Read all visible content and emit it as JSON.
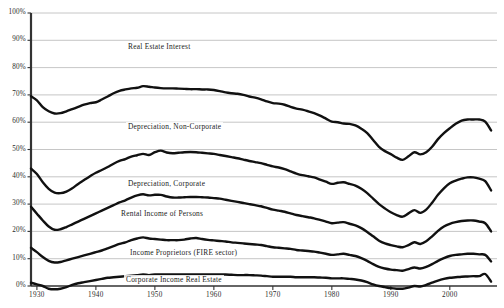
{
  "chart_data": {
    "type": "line",
    "title": "",
    "subtitle": "",
    "xlabel": "",
    "ylabel": "",
    "xlim": [
      1929,
      2008
    ],
    "ylim": [
      0,
      100
    ],
    "grid": true,
    "grid_orientation": "horizontal",
    "legend_position": "inline-band-labels",
    "y_tick_labels": [
      "0%",
      "10%",
      "20%",
      "30%",
      "40%",
      "50%",
      "60%",
      "70%",
      "80%",
      "90%",
      "100%"
    ],
    "y_tick_values": [
      0,
      10,
      20,
      30,
      40,
      50,
      60,
      70,
      80,
      90,
      100
    ],
    "x_tick_labels": [
      "1930",
      "1940",
      "1950",
      "1960",
      "1970",
      "1980",
      "1990",
      "2000"
    ],
    "x_tick_values": [
      1930,
      1940,
      1950,
      1960,
      1970,
      1980,
      1990,
      2000
    ],
    "line_color": "#111111",
    "grid_color": "#b8b8b8",
    "axis_color": "#333333",
    "band_labels": [
      "Real Estate Interest",
      "Depreciation, Non-Corporate",
      "Depreciation, Corporate",
      "Rental Income of Persons",
      "Income Proprietors (FIRE sector)",
      "Corporate Income Real Estate"
    ],
    "x": [
      1929,
      1930,
      1931,
      1932,
      1933,
      1934,
      1935,
      1936,
      1937,
      1938,
      1939,
      1940,
      1941,
      1942,
      1943,
      1944,
      1945,
      1946,
      1947,
      1948,
      1949,
      1950,
      1951,
      1952,
      1953,
      1954,
      1955,
      1956,
      1957,
      1958,
      1959,
      1960,
      1961,
      1962,
      1963,
      1964,
      1965,
      1966,
      1967,
      1968,
      1969,
      1970,
      1971,
      1972,
      1973,
      1974,
      1975,
      1976,
      1977,
      1978,
      1979,
      1980,
      1981,
      1982,
      1983,
      1984,
      1985,
      1986,
      1987,
      1988,
      1989,
      1990,
      1991,
      1992,
      1993,
      1994,
      1995,
      1996,
      1997,
      1998,
      1999,
      2000,
      2001,
      2002,
      2003,
      2004,
      2005,
      2006,
      2007
    ],
    "series": [
      {
        "name": "Real Estate Interest",
        "description": "Cumulative top boundary (total, 100% minus residual)",
        "values": [
          69.5,
          68.0,
          65.5,
          64.0,
          63.2,
          63.3,
          64.0,
          64.8,
          65.6,
          66.4,
          67.0,
          67.3,
          68.3,
          69.4,
          70.6,
          71.5,
          72.0,
          72.4,
          72.6,
          73.2,
          73.0,
          72.7,
          72.5,
          72.4,
          72.4,
          72.3,
          72.2,
          72.1,
          72.1,
          72.0,
          72.0,
          71.8,
          71.4,
          70.9,
          70.6,
          70.4,
          70.0,
          69.4,
          69.0,
          68.4,
          67.6,
          67.0,
          66.8,
          66.4,
          65.6,
          65.0,
          64.6,
          64.0,
          63.3,
          62.4,
          61.3,
          60.2,
          60.0,
          59.5,
          59.4,
          58.8,
          57.6,
          56.0,
          53.5,
          51.0,
          49.4,
          48.3,
          47.0,
          46.2,
          47.5,
          49.0,
          48.2,
          49.0,
          51.0,
          53.8,
          56.0,
          57.8,
          59.4,
          60.6,
          61.0,
          61.0,
          61.0,
          60.2,
          57.0
        ]
      },
      {
        "name": "Depreciation, Non-Corporate",
        "description": "Cumulative boundary below Real Estate Interest",
        "values": [
          43.0,
          41.0,
          38.0,
          35.6,
          34.2,
          34.0,
          34.6,
          35.8,
          37.4,
          38.8,
          40.2,
          41.5,
          42.5,
          43.6,
          44.8,
          45.8,
          46.5,
          47.4,
          47.9,
          48.4,
          48.0,
          49.0,
          49.6,
          48.9,
          48.6,
          48.8,
          49.0,
          49.1,
          49.0,
          48.8,
          48.6,
          48.4,
          48.0,
          47.6,
          47.2,
          46.8,
          46.3,
          45.8,
          45.4,
          45.0,
          44.4,
          43.8,
          43.4,
          42.8,
          42.0,
          41.2,
          40.6,
          40.2,
          39.8,
          39.0,
          38.2,
          37.4,
          37.8,
          38.0,
          37.4,
          36.8,
          35.6,
          34.0,
          32.0,
          30.0,
          28.4,
          27.0,
          26.0,
          25.4,
          26.6,
          27.8,
          26.8,
          28.0,
          30.5,
          33.4,
          35.8,
          37.6,
          38.6,
          39.3,
          39.8,
          39.8,
          39.3,
          38.4,
          35.0
        ]
      },
      {
        "name": "Depreciation, Corporate",
        "description": "Cumulative boundary below Depreciation, Non-Corporate",
        "values": [
          29.0,
          26.5,
          24.0,
          21.8,
          20.6,
          20.8,
          21.6,
          22.6,
          23.6,
          24.6,
          25.6,
          26.6,
          27.6,
          28.6,
          29.6,
          30.6,
          31.4,
          32.4,
          33.2,
          33.6,
          33.2,
          33.4,
          33.4,
          32.8,
          32.4,
          32.4,
          32.5,
          32.6,
          32.6,
          32.5,
          32.4,
          32.2,
          32.0,
          31.6,
          31.2,
          30.8,
          30.4,
          30.0,
          29.6,
          29.2,
          28.6,
          28.0,
          27.6,
          27.2,
          26.6,
          26.0,
          25.6,
          25.2,
          24.8,
          24.2,
          23.6,
          23.0,
          23.2,
          23.4,
          22.8,
          22.2,
          21.2,
          19.8,
          18.2,
          16.6,
          15.6,
          15.0,
          14.5,
          14.2,
          15.0,
          16.0,
          15.4,
          16.4,
          18.2,
          20.2,
          21.8,
          22.8,
          23.4,
          23.8,
          24.0,
          24.0,
          23.6,
          23.0,
          20.0
        ]
      },
      {
        "name": "Rental Income of Persons",
        "description": "Cumulative boundary below Depreciation, Corporate",
        "values": [
          14.0,
          12.4,
          10.6,
          9.2,
          8.6,
          8.8,
          9.4,
          10.0,
          10.6,
          11.2,
          11.8,
          12.4,
          13.0,
          13.8,
          14.6,
          15.4,
          16.0,
          16.8,
          17.4,
          17.8,
          17.4,
          17.2,
          17.0,
          16.8,
          16.8,
          16.8,
          17.0,
          17.4,
          17.6,
          17.2,
          16.9,
          16.7,
          16.5,
          16.3,
          16.0,
          15.8,
          15.6,
          15.4,
          15.2,
          15.0,
          14.6,
          14.2,
          14.0,
          13.8,
          13.6,
          13.2,
          13.0,
          12.8,
          12.6,
          12.2,
          11.8,
          11.4,
          11.6,
          11.8,
          11.4,
          11.0,
          10.2,
          9.2,
          8.0,
          7.0,
          6.4,
          6.0,
          5.8,
          5.6,
          6.2,
          6.8,
          6.4,
          7.0,
          8.0,
          9.2,
          10.2,
          11.0,
          11.4,
          11.6,
          11.8,
          11.8,
          11.6,
          11.4,
          9.0
        ]
      },
      {
        "name": "Corporate Income Real Estate",
        "description": "Cumulative bottom boundary",
        "values": [
          1.2,
          0.6,
          0.0,
          -1.0,
          -1.2,
          -1.0,
          -0.4,
          0.4,
          1.0,
          1.4,
          1.8,
          2.2,
          2.6,
          3.0,
          3.2,
          3.4,
          3.6,
          3.8,
          4.0,
          4.2,
          4.0,
          4.2,
          4.2,
          4.2,
          4.2,
          4.2,
          4.2,
          4.2,
          4.2,
          4.2,
          4.2,
          4.2,
          4.2,
          4.2,
          4.1,
          4.0,
          4.0,
          4.0,
          3.9,
          3.8,
          3.6,
          3.4,
          3.4,
          3.4,
          3.4,
          3.2,
          3.2,
          3.2,
          3.2,
          3.1,
          3.0,
          2.8,
          2.8,
          2.8,
          2.6,
          2.4,
          2.0,
          1.4,
          0.6,
          0.0,
          -0.4,
          -0.8,
          -1.0,
          -1.0,
          -0.6,
          0.0,
          -0.2,
          0.4,
          1.2,
          2.0,
          2.6,
          3.0,
          3.2,
          3.4,
          3.5,
          3.6,
          3.6,
          4.4,
          1.6
        ]
      }
    ]
  }
}
